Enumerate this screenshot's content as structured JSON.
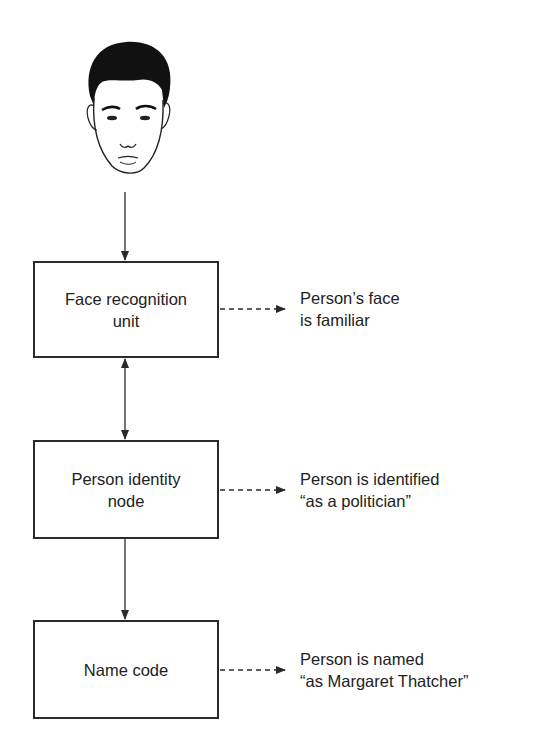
{
  "diagram": {
    "type": "flowchart",
    "stimulus": {
      "icon": "face-drawing-icon",
      "description": "line drawing of a man's face"
    },
    "nodes": [
      {
        "id": "face-recognition-unit",
        "lines": [
          "Face recognition",
          "unit"
        ]
      },
      {
        "id": "person-identity-node",
        "lines": [
          "Person identity",
          "node"
        ]
      },
      {
        "id": "name-code",
        "lines": [
          "Name code"
        ]
      }
    ],
    "outputs": [
      {
        "from": "face-recognition-unit",
        "lines": [
          "Person’s face",
          "is familiar"
        ]
      },
      {
        "from": "person-identity-node",
        "lines": [
          "Person is identified",
          "“as a politician”"
        ]
      },
      {
        "from": "name-code",
        "lines": [
          "Person is named",
          "“as Margaret Thatcher”"
        ]
      }
    ],
    "edges": [
      {
        "from": "face",
        "to": "face-recognition-unit",
        "style": "solid",
        "direction": "forward"
      },
      {
        "from": "face-recognition-unit",
        "to": "person-identity-node",
        "style": "solid",
        "direction": "bidirectional"
      },
      {
        "from": "person-identity-node",
        "to": "name-code",
        "style": "solid",
        "direction": "forward"
      },
      {
        "from": "face-recognition-unit",
        "to": "output-0",
        "style": "dashed",
        "direction": "forward"
      },
      {
        "from": "person-identity-node",
        "to": "output-1",
        "style": "dashed",
        "direction": "forward"
      },
      {
        "from": "name-code",
        "to": "output-2",
        "style": "dashed",
        "direction": "forward"
      }
    ],
    "colors": {
      "stroke": "#2a2a2a",
      "text": "#222222",
      "background": "#ffffff"
    }
  }
}
